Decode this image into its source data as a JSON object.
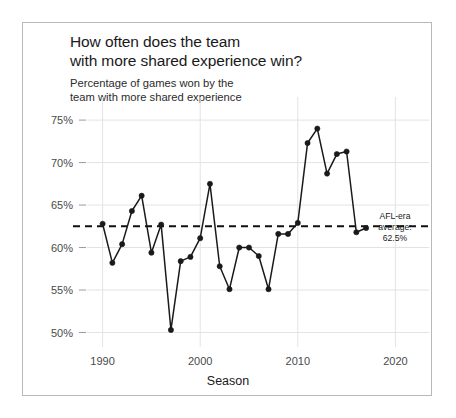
{
  "figure": {
    "title_line1": "How often does the team",
    "title_line2": "with more shared experience win?",
    "subtitle_line1": "Percentage of games won by the",
    "subtitle_line2": "team with more shared experience",
    "border_color": "#b9b9b9",
    "background_color": "#ffffff"
  },
  "annotation": {
    "line1": "AFL-era",
    "line2": "average:",
    "line3": "62.5%"
  },
  "axes": {
    "x_title": "Season",
    "y_ticks": [
      "50%",
      "55%",
      "60%",
      "65%",
      "70%",
      "75%"
    ],
    "x_ticks": [
      "1990",
      "2000",
      "2010",
      "2020"
    ]
  },
  "chart_data": {
    "type": "line",
    "title": "How often does the team with more shared experience win?",
    "subtitle": "Percentage of games won by the team with more shared experience",
    "xlabel": "Season",
    "ylabel": "",
    "xlim": [
      1988.4,
      2021.6
    ],
    "ylim": [
      49.0,
      75.6
    ],
    "grid": true,
    "legend": "none",
    "marker": "circle",
    "line_color": "#1a1a1a",
    "x": [
      1990,
      1991,
      1992,
      1993,
      1994,
      1995,
      1996,
      1997,
      1998,
      1999,
      2000,
      2001,
      2002,
      2003,
      2004,
      2005,
      2006,
      2007,
      2008,
      2009,
      2010,
      2011,
      2012,
      2013,
      2014,
      2015,
      2016,
      2017
    ],
    "values": [
      62.8,
      58.2,
      60.4,
      64.3,
      66.1,
      59.4,
      62.7,
      50.3,
      58.4,
      58.9,
      61.1,
      67.5,
      57.8,
      55.1,
      60.0,
      60.0,
      59.0,
      55.1,
      61.6,
      61.6,
      62.9,
      72.3,
      74.0,
      68.7,
      71.0,
      71.3,
      61.8,
      62.3
    ],
    "reference_line": {
      "label": "AFL-era average: 62.5%",
      "value": 62.5,
      "style": "dashed",
      "color": "#111111"
    },
    "y_tick_values": [
      50,
      55,
      60,
      65,
      70,
      75
    ],
    "x_tick_values": [
      1990,
      2000,
      2010,
      2020
    ]
  }
}
